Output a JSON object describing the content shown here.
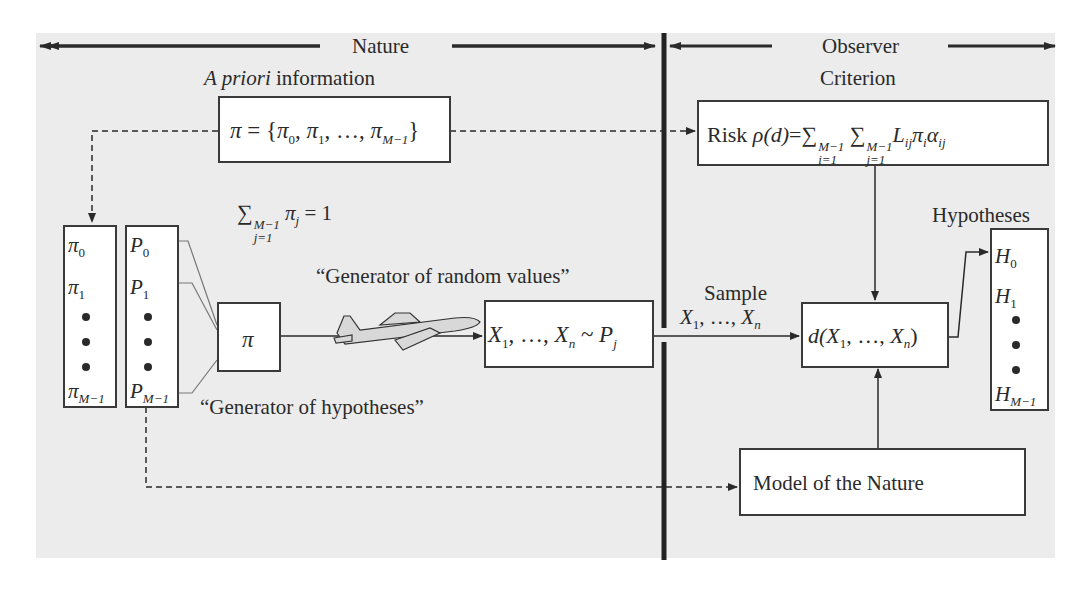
{
  "header": {
    "nature_label": "Nature",
    "observer_label": "Observer",
    "criterion_label": "Criterion"
  },
  "a_priori": {
    "label_italic": "A priori",
    "label_rest": " information",
    "pi_set": {
      "lhs": "π",
      "eq": " = {",
      "items": [
        "π",
        "π",
        "π"
      ],
      "subs": [
        "0",
        "1",
        "M−1"
      ],
      "ellipsis": "…",
      "close": "}"
    }
  },
  "constraint": {
    "sigma": "∑",
    "upper": "M−1",
    "lower": "j=1",
    "term": "π",
    "term_sub": "j",
    "rhs": " = 1"
  },
  "prior_column": {
    "items": [
      {
        "sym": "π",
        "sub": "0"
      },
      {
        "sym": "π",
        "sub": "1"
      },
      {
        "sym": "π",
        "sub": "M−1"
      }
    ]
  },
  "distribution_column": {
    "items": [
      {
        "sym": "P",
        "sub": "0"
      },
      {
        "sym": "P",
        "sub": "1"
      },
      {
        "sym": "P",
        "sub": "M−1"
      }
    ]
  },
  "selector_box": {
    "label": "π"
  },
  "generator_hypotheses_label": "“Generator of hypotheses”",
  "generator_random_label": "“Generator of random values”",
  "sample_box": {
    "x": "X",
    "x1_sub": "1",
    "mid": ", …, ",
    "xn_sub": "n",
    "tilde": " ~ ",
    "p": "P",
    "p_sub": "j"
  },
  "sample_label": {
    "title": "Sample",
    "x": "X",
    "x1_sub": "1",
    "mid": ", …, ",
    "xn_sub": "n"
  },
  "risk_box": {
    "prefix": "Risk ",
    "rho": "ρ(d)",
    "eq": "=",
    "sigma": "∑",
    "sum1_upper": "M−1",
    "sum1_lower": "i=1",
    "sum2_upper": "M−1",
    "sum2_lower": "j=1",
    "L": "L",
    "L_sub": "ij",
    "pi": "π",
    "pi_sub": "i",
    "alpha": "α",
    "alpha_sub": "ij"
  },
  "decision_box": {
    "d": "d(",
    "x": "X",
    "x1_sub": "1",
    "mid": ", …, ",
    "xn_sub": "n",
    "close": ")"
  },
  "hypotheses": {
    "title": "Hypotheses",
    "items": [
      {
        "sym": "H",
        "sub": "0"
      },
      {
        "sym": "H",
        "sub": "1"
      },
      {
        "sym": "H",
        "sub": "M−1"
      }
    ]
  },
  "model_box": {
    "label": "Model of the Nature"
  },
  "colors": {
    "background_panel": "#ececec",
    "box_fill": "#ffffff",
    "stroke": "#2a2a2a"
  }
}
